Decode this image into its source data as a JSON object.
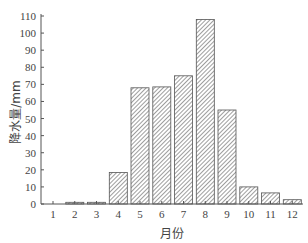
{
  "chart_data": {
    "type": "bar",
    "title": "",
    "xlabel": "月份",
    "ylabel": "降水量/mm",
    "categories": [
      "1",
      "2",
      "3",
      "4",
      "5",
      "6",
      "7",
      "8",
      "9",
      "10",
      "11",
      "12"
    ],
    "values": [
      0,
      1,
      1,
      18.5,
      68,
      68.5,
      75,
      108,
      55,
      10,
      6.5,
      2.5
    ],
    "ylim": [
      0,
      110
    ],
    "yticks": [
      0,
      10,
      20,
      30,
      40,
      50,
      60,
      70,
      80,
      90,
      100,
      110
    ],
    "grid": false,
    "legend": null,
    "bar_style": "diagonal-hatch",
    "colors": {
      "bar_fill": "#ffffff",
      "hatch": "#666666",
      "bar_edge": "#555555",
      "axis": "#555555"
    }
  }
}
